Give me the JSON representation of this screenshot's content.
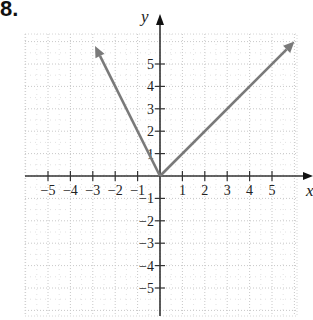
{
  "problem_number": "8.",
  "chart_data": {
    "type": "line",
    "title": "",
    "xlabel": "x",
    "ylabel": "y",
    "xlim": [
      -6,
      6
    ],
    "ylim": [
      -6,
      6
    ],
    "grid": true,
    "x_ticks": [
      -5,
      -4,
      -3,
      -2,
      -1,
      1,
      2,
      3,
      4,
      5
    ],
    "y_ticks": [
      -5,
      -4,
      -3,
      -2,
      -1,
      1,
      2,
      3,
      4,
      5
    ],
    "x_tick_labels": [
      "−5",
      "−4",
      "−3",
      "−2",
      "−1",
      "1",
      "2",
      "3",
      "4",
      "5"
    ],
    "y_tick_labels": [
      "−5",
      "−4",
      "−3",
      "−2",
      "−1",
      "1",
      "2",
      "3",
      "4",
      "5"
    ],
    "series": [
      {
        "name": "left ray (y = -2x, x ≤ 0)",
        "x": [
          0,
          -2.9
        ],
        "y": [
          0,
          5.8
        ],
        "arrow_end": true
      },
      {
        "name": "right ray (y = x, x ≥ 0)",
        "x": [
          0,
          6.0
        ],
        "y": [
          0,
          6.0
        ],
        "arrow_end": true
      }
    ],
    "colors": {
      "line": "#7a7a7a",
      "axis": "#333333",
      "grid": "#c8c8c8"
    }
  }
}
